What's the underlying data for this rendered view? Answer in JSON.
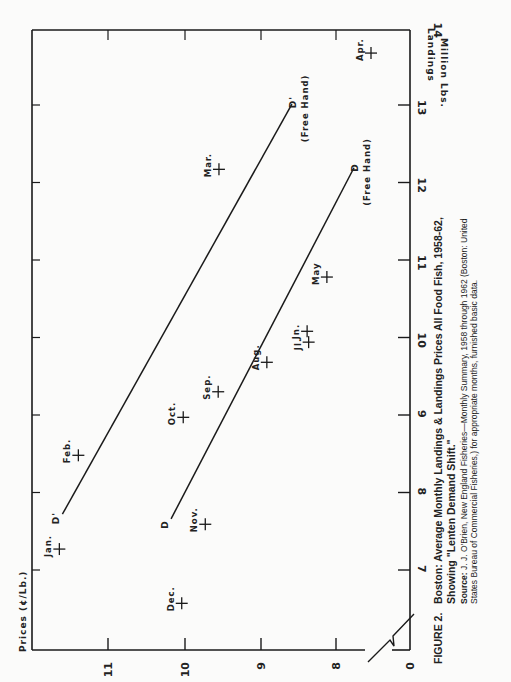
{
  "figure": {
    "number": "FIGURE 2.",
    "title_line1": "Boston: Average Monthly Landings & Landings  Prices All Food Fish, 1958-62,",
    "title_line2": "Showing \"Lenten Demand Shift.\"",
    "source_label": "Source:",
    "source_line1": " J. J. O'Brien,  New  England  Fisheries—Monthly  Summary, 1958 through 1962 (Boston: United",
    "source_line2": "States Bureau of Commercial Fisheries,) for appropriate months, furnished basic data."
  },
  "chart_data": {
    "type": "scatter",
    "title": "Boston: Average Monthly Landings & Landings Prices All Food Fish, 1958-62, Showing \"Lenten Demand Shift.\"",
    "xlabel": "Landings Million Lbs.",
    "ylabel": "Prices (¢/Lb.)",
    "orientation_note": "figure printed rotated 90° counter-clockwise",
    "xlim": [
      6.0,
      14.0
    ],
    "ylim": [
      7.0,
      12.0
    ],
    "y_axis_break": true,
    "x_ticks": [
      7,
      8,
      9,
      10,
      11,
      12,
      13,
      14
    ],
    "y_ticks": [
      0,
      8,
      9,
      10,
      11
    ],
    "grid": false,
    "points": [
      {
        "label": "Jan.",
        "x": 7.27,
        "y": 11.64
      },
      {
        "label": "Feb.",
        "x": 8.48,
        "y": 11.39
      },
      {
        "label": "Mar.",
        "x": 12.17,
        "y": 9.54
      },
      {
        "label": "Apr.",
        "x": 13.67,
        "y": 7.3
      },
      {
        "label": "May",
        "x": 10.78,
        "y": 8.12
      },
      {
        "label": "Jn.",
        "x": 10.08,
        "y": 8.38
      },
      {
        "label": "Jl.",
        "x": 9.94,
        "y": 8.36
      },
      {
        "label": "Aug.",
        "x": 9.68,
        "y": 8.91
      },
      {
        "label": "Sep.",
        "x": 9.3,
        "y": 9.55
      },
      {
        "label": "Oct.",
        "x": 8.97,
        "y": 10.01
      },
      {
        "label": "Nov.",
        "x": 7.59,
        "y": 9.72
      },
      {
        "label": "Dec.",
        "x": 6.57,
        "y": 10.03
      }
    ],
    "lines": [
      {
        "name": "D' (Free Hand)",
        "start_label": "D'",
        "end_label": "D'",
        "note": "(Free Hand)",
        "x": [
          7.72,
          13.01
        ],
        "y": [
          11.6,
          8.58
        ]
      },
      {
        "name": "D (Free Hand)",
        "start_label": "D",
        "end_label": "D",
        "note": "(Free Hand)",
        "x": [
          7.66,
          12.19
        ],
        "y": [
          10.17,
          7.64
        ]
      }
    ]
  },
  "axes": {
    "x_label_line1": "Landings",
    "x_label_line2": "Million Lbs.",
    "y_label": "Prices (¢/Lb.)",
    "x_tick_labels": [
      "7",
      "8",
      "9",
      "10",
      "11",
      "12",
      "13",
      "14"
    ],
    "y_tick_labels": [
      "0",
      "8",
      "9",
      "10",
      "11"
    ]
  },
  "annotations": {
    "free_hand": "(Free Hand)",
    "d_prime": "D'",
    "d": "D"
  },
  "colors": {
    "ink": "#1a1a1a",
    "paper": "#fbfbfa"
  }
}
